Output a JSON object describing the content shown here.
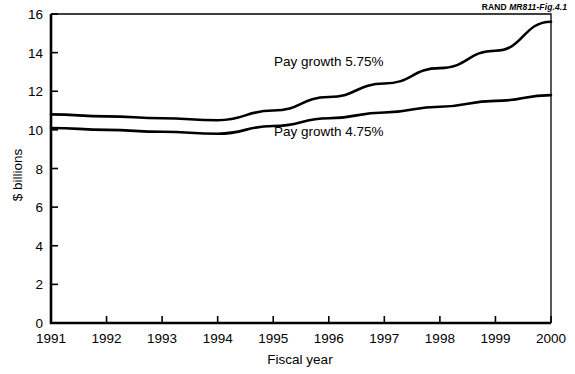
{
  "figure": {
    "id_prefix": "RAND ",
    "id_code": "MR811-Fig.4.1"
  },
  "chart_data": {
    "type": "line",
    "title": "",
    "xlabel": "Fiscal year",
    "ylabel": "$ billions",
    "x": [
      1991,
      1992,
      1993,
      1994,
      1995,
      1996,
      1997,
      1998,
      1999,
      2000
    ],
    "xticklabels": [
      "1991",
      "1992",
      "1993",
      "1994",
      "1995",
      "1996",
      "1997",
      "1998",
      "1999",
      "2000"
    ],
    "yticklabels": [
      "0",
      "2",
      "4",
      "6",
      "8",
      "10",
      "12",
      "14",
      "16"
    ],
    "yticks": [
      0,
      2,
      4,
      6,
      8,
      10,
      12,
      14,
      16
    ],
    "xlim": [
      1991,
      2000
    ],
    "ylim": [
      0,
      16
    ],
    "grid": false,
    "legend": "inline-annotations",
    "series": [
      {
        "name": "Pay growth 5.75%",
        "label": "Pay growth 5.75%",
        "color": "#000000",
        "values": [
          10.8,
          10.7,
          10.6,
          10.5,
          11.0,
          11.7,
          12.4,
          13.2,
          14.1,
          15.6
        ]
      },
      {
        "name": "Pay growth 4.75%",
        "label": "Pay growth 4.75%",
        "color": "#000000",
        "values": [
          10.1,
          10.0,
          9.9,
          9.8,
          10.2,
          10.6,
          10.9,
          11.2,
          11.5,
          11.8
        ]
      }
    ],
    "annotations": [
      {
        "text": "Pay growth 5.75%",
        "x": 1996.0,
        "y": 13.3
      },
      {
        "text": "Pay growth 4.75%",
        "x": 1996.0,
        "y": 9.7
      }
    ]
  }
}
